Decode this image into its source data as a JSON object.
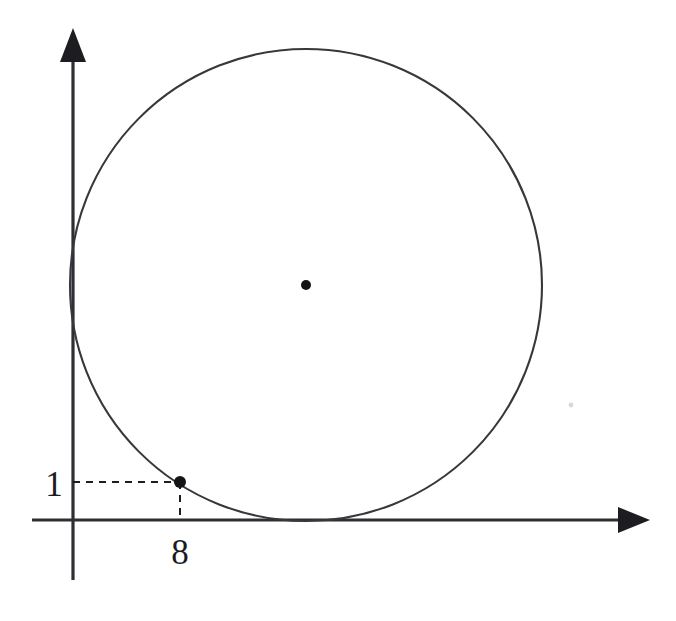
{
  "figure": {
    "type": "geometry-diagram",
    "background_color": "#ffffff",
    "ink_color": "#2e2e33"
  },
  "axes": {
    "x_axis": {
      "name": "x-axis",
      "start_x": 32,
      "end_x": 648,
      "y": 520,
      "arrow": "right",
      "arrow_tip_x": 648
    },
    "y_axis": {
      "name": "y-axis",
      "x": 73,
      "start_y": 580,
      "end_y": 28,
      "arrow": "up",
      "arrow_tip_y": 28
    },
    "origin": {
      "x": 73,
      "y": 520
    }
  },
  "circle": {
    "name": "circle",
    "center": {
      "x": 306,
      "y": 285
    },
    "radius": 236,
    "tangent_to": [
      "x-axis",
      "y-axis"
    ],
    "center_marked": true,
    "center_dot_radius": 5
  },
  "points": [
    {
      "name": "center-point",
      "label": "",
      "cx": 306,
      "cy": 285,
      "dot_radius": 5
    },
    {
      "name": "point-on-circle",
      "label": "(8, 1)",
      "cx": 180,
      "cy": 482,
      "dot_radius": 6
    }
  ],
  "guides": [
    {
      "name": "horizontal-dashed-guide",
      "from": {
        "x": 73,
        "y": 482
      },
      "to": {
        "x": 180,
        "y": 482
      },
      "style": "dashed"
    },
    {
      "name": "vertical-dashed-guide",
      "from": {
        "x": 180,
        "y": 482
      },
      "to": {
        "x": 180,
        "y": 520
      },
      "style": "dashed"
    }
  ],
  "labels": {
    "y_tick": {
      "text": "1",
      "x": 54,
      "y": 496,
      "anchor": "middle"
    },
    "x_tick": {
      "text": "8",
      "x": 180,
      "y": 564,
      "anchor": "middle"
    }
  },
  "chart_data": {
    "type": "scatter",
    "title": "",
    "xlabel": "",
    "ylabel": "",
    "grid": false,
    "legend": null,
    "annotations": [
      "1",
      "8"
    ],
    "shapes": [
      {
        "kind": "circle",
        "center_px": [
          306,
          285
        ],
        "radius_px": 236,
        "tangent_x_axis": true,
        "tangent_y_axis": true
      }
    ],
    "points_px": [
      {
        "label": "center",
        "x": 306,
        "y": 285
      },
      {
        "label": "(8, 1)",
        "x": 180,
        "y": 482
      }
    ],
    "tick_labels": {
      "x": [
        "8"
      ],
      "y": [
        "1"
      ]
    }
  }
}
